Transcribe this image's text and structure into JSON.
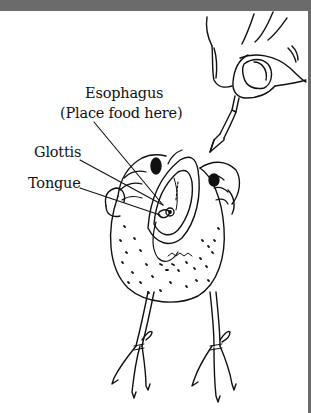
{
  "diagram": {
    "labels": {
      "esophagus": "Esophagus",
      "esophagus_note": "(Place food here)",
      "glottis": "Glottis",
      "tongue": "Tongue"
    }
  },
  "colors": {
    "frame": "#6b6b6b",
    "ink": "#111111",
    "background": "#ffffff"
  }
}
